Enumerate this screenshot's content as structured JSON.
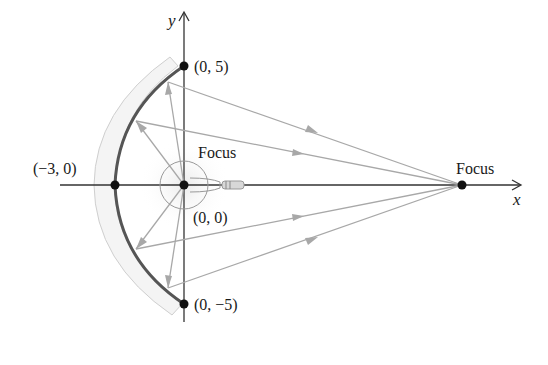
{
  "diagram": {
    "type": "hyperbolic-mirror-reflection",
    "axes": {
      "x_label": "x",
      "y_label": "y"
    },
    "points": {
      "origin": {
        "label": "(0, 0)",
        "x": 184,
        "y": 185
      },
      "top": {
        "label": "(0, 5)",
        "x": 184,
        "y": 66
      },
      "bottom": {
        "label": "(0, −5)",
        "x": 184,
        "y": 304
      },
      "vertex": {
        "label": "(−3, 0)",
        "x": 115,
        "y": 185
      },
      "right_focus": {
        "label": "Focus",
        "x": 462,
        "y": 185
      }
    },
    "labels": {
      "origin_focus": "Focus",
      "right_focus": "Focus",
      "origin": "(0, 0)",
      "top": "(0, 5)",
      "bottom": "(0, −5)",
      "vertex": "(−3, 0)"
    },
    "colors": {
      "axis": "#333333",
      "mirror_curve": "#555555",
      "ray": "#a8a8a8",
      "mirror_shadow": "#d6d6d6",
      "point": "#111111"
    },
    "rays": [
      {
        "from": [
          184,
          185
        ],
        "hit": [
          168,
          82
        ],
        "to": [
          462,
          185
        ]
      },
      {
        "from": [
          184,
          185
        ],
        "hit": [
          136,
          121
        ],
        "to": [
          462,
          185
        ]
      },
      {
        "from": [
          184,
          185
        ],
        "hit": [
          136,
          249
        ],
        "to": [
          462,
          185
        ]
      },
      {
        "from": [
          184,
          185
        ],
        "hit": [
          168,
          288
        ],
        "to": [
          462,
          185
        ]
      }
    ]
  }
}
